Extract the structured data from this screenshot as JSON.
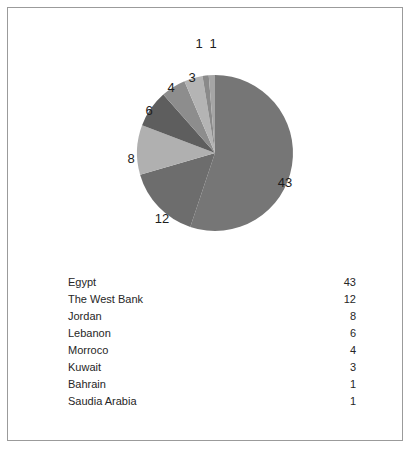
{
  "chart_data": {
    "type": "pie",
    "title": "",
    "subtitle": "",
    "xlabel": "",
    "ylabel": "",
    "legend_position": "below-as-table",
    "grid": false,
    "total": 78,
    "start_angle_deg": 0,
    "direction": "clockwise",
    "categories": [
      "Egypt",
      "The West Bank",
      "Jordan",
      "Lebanon",
      "Morroco",
      "Kuwait",
      "Bahrain",
      "Saudia Arabia"
    ],
    "values": [
      43,
      12,
      8,
      6,
      4,
      3,
      1,
      1
    ],
    "value_labels": [
      "43",
      "12",
      "8",
      "6",
      "4",
      "3",
      "1",
      "1"
    ],
    "slice_colors": [
      "#767676",
      "#6d6d6d",
      "#b0b0b0",
      "#5e5e5e",
      "#8d8d8d",
      "#b4b4b4",
      "#8a8a8a",
      "#a5a5a5"
    ]
  },
  "legend": {
    "rows": [
      {
        "category": "Egypt",
        "value": "43"
      },
      {
        "category": "The West Bank",
        "value": "12"
      },
      {
        "category": "Jordan",
        "value": "8"
      },
      {
        "category": "Lebanon",
        "value": "6"
      },
      {
        "category": "Morroco",
        "value": "4"
      },
      {
        "category": "Kuwait",
        "value": "3"
      },
      {
        "category": "Bahrain",
        "value": "1"
      },
      {
        "category": "Saudia Arabia",
        "value": "1"
      }
    ]
  },
  "slice_label_text": {
    "egypt": "43",
    "west_bank": "12",
    "jordan": "8",
    "lebanon": "6",
    "morroco": "4",
    "kuwait": "3",
    "bahrain": "1",
    "saudia_arabia": "1"
  },
  "colors": {
    "page_background": "#ffffff",
    "border": "#9b9b9b",
    "text": "#262626",
    "label_text": "#1d1d1d"
  }
}
